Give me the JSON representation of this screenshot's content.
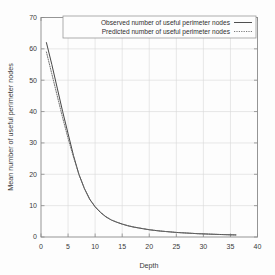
{
  "chart_data": {
    "type": "line",
    "title": "",
    "xlabel": "Depth",
    "ylabel": "Mean number of useful perimeter nodes",
    "xlim": [
      0,
      40
    ],
    "ylim": [
      0,
      70
    ],
    "xticks": [
      0,
      5,
      10,
      15,
      20,
      25,
      30,
      35,
      40
    ],
    "yticks": [
      0,
      10,
      20,
      30,
      40,
      50,
      60,
      70
    ],
    "grid": true,
    "legend_position": "top-center",
    "series": [
      {
        "name": "Observed number of useful perimeter nodes",
        "style": "solid",
        "color": "#3c3c3c",
        "x": [
          1,
          2,
          3,
          4,
          5,
          6,
          7,
          8,
          9,
          10,
          11,
          12,
          13,
          14,
          15,
          16,
          17,
          18,
          19,
          20,
          21,
          22,
          23,
          24,
          25,
          26,
          27,
          28,
          29,
          30,
          31,
          32,
          33,
          34,
          35,
          36
        ],
        "y": [
          62.0,
          55.0,
          47.5,
          40.0,
          33.0,
          26.0,
          20.0,
          15.5,
          12.0,
          9.6,
          7.8,
          6.4,
          5.4,
          4.7,
          4.1,
          3.6,
          3.2,
          2.9,
          2.6,
          2.3,
          2.1,
          1.9,
          1.75,
          1.6,
          1.45,
          1.35,
          1.25,
          1.15,
          1.05,
          1.0,
          0.92,
          0.86,
          0.8,
          0.75,
          0.7,
          0.66
        ]
      },
      {
        "name": "Predicted number of useful perimeter nodes",
        "style": "dotted",
        "color": "#6a6a6a",
        "x": [
          1,
          2,
          3,
          4,
          5,
          6,
          7,
          8,
          9,
          10,
          11,
          12,
          13,
          14,
          15,
          16,
          17,
          18,
          19,
          20,
          21,
          22,
          23,
          24,
          25,
          26,
          27,
          28,
          29,
          30,
          31,
          32,
          33,
          34,
          35,
          36
        ],
        "y": [
          59.0,
          52.0,
          45.0,
          38.0,
          31.5,
          25.5,
          20.0,
          15.6,
          12.1,
          9.7,
          7.9,
          6.5,
          5.45,
          4.75,
          4.15,
          3.65,
          3.25,
          2.92,
          2.62,
          2.35,
          2.12,
          1.92,
          1.76,
          1.61,
          1.46,
          1.36,
          1.26,
          1.16,
          1.06,
          1.0,
          0.93,
          0.87,
          0.81,
          0.76,
          0.71,
          0.67
        ]
      }
    ]
  },
  "legend": {
    "entries": [
      {
        "label": "Observed number of useful perimeter nodes",
        "style": "solid"
      },
      {
        "label": "Predicted number of useful perimeter nodes",
        "style": "dotted"
      }
    ]
  },
  "axes": {
    "x_label": "Depth",
    "y_label": "Mean number of useful perimeter nodes",
    "x_tick_labels": [
      "0",
      "5",
      "10",
      "15",
      "20",
      "25",
      "30",
      "35",
      "40"
    ],
    "y_tick_labels": [
      "0",
      "10",
      "20",
      "30",
      "40",
      "50",
      "60",
      "70"
    ]
  },
  "colors": {
    "background": "#fdfdfd",
    "frame": "#8a8a8a",
    "grid": "#d8d8d8",
    "observed": "#3c3c3c",
    "predicted": "#6a6a6a",
    "text": "#3a3a3a"
  }
}
